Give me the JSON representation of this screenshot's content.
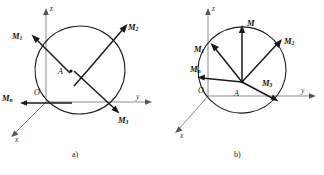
{
  "figure": {
    "caption_a": "a)",
    "caption_b": "b)"
  },
  "panel_a": {
    "name": "moment-vectors-through-body",
    "axes": {
      "x": "x",
      "y": "y",
      "z": "z"
    },
    "origin_label": "O",
    "center_label": "A",
    "vectors": [
      {
        "id": "M1",
        "base": "M",
        "sub": "1"
      },
      {
        "id": "M2",
        "base": "M",
        "sub": "2"
      },
      {
        "id": "M3",
        "base": "M",
        "sub": "3"
      },
      {
        "id": "Mn",
        "base": "M",
        "sub": "n"
      }
    ]
  },
  "panel_b": {
    "name": "concurrent-moment-vectors",
    "axes": {
      "x": "x",
      "y": "y",
      "z": "z"
    },
    "origin_label": "O",
    "center_label": "A",
    "resultant": {
      "id": "M",
      "base": "M",
      "sub": ""
    },
    "vectors": [
      {
        "id": "M1",
        "base": "M",
        "sub": "1"
      },
      {
        "id": "M2",
        "base": "M",
        "sub": "2"
      },
      {
        "id": "M3",
        "base": "M",
        "sub": "3"
      },
      {
        "id": "Mn",
        "base": "M",
        "sub": "n"
      }
    ]
  },
  "colors": {
    "ink": "#1a1a1a",
    "axis": "#8a8a8a",
    "background": "#ffffff"
  }
}
